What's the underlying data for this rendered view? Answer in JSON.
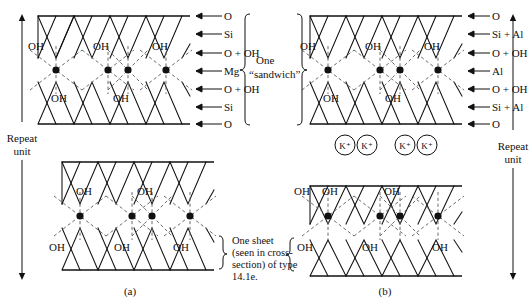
{
  "figure": {
    "panels": [
      {
        "id": "a",
        "caption": "(a)",
        "layer_labels": [
          "O",
          "Si",
          "O + OH",
          "Mg",
          "O + OH",
          "Si",
          "O"
        ],
        "bracket_note_line1": "One",
        "bracket_note_line2": "“sandwich”",
        "repeat_unit_line1": "Repeat",
        "repeat_unit_line2": "unit",
        "sheet_note": [
          "One sheet",
          "(seen in cross-",
          "section) of type",
          "14.1e."
        ],
        "hydroxyl_label": "OH",
        "top_block_oh_upper": [
          "OH",
          "OH",
          "OH"
        ],
        "top_block_oh_lower": [
          "OH",
          "OH"
        ],
        "bottom_block_oh_upper": [
          "OH",
          "OH"
        ],
        "bottom_block_oh_lower": [
          "OH",
          "OH",
          "OH"
        ]
      },
      {
        "id": "b",
        "caption": "(b)",
        "layer_labels": [
          "O",
          "Si + Al",
          "O + OH",
          "Al",
          "O + OH",
          "Si + Al",
          "O"
        ],
        "bracket_note_line1": "One",
        "bracket_note_line2": "“sandwich”",
        "repeat_unit_line1": "Repeat",
        "repeat_unit_line2": "unit",
        "interlayer_ions": [
          "K⁺",
          "K⁺",
          "K⁺",
          "K⁺"
        ],
        "hydroxyl_label": "OH",
        "top_block_oh_upper": [
          "OH",
          "OH",
          "OH"
        ],
        "top_block_oh_lower": [
          "OH",
          "OH"
        ],
        "bottom_block_oh_upper": [
          "OH",
          "OH",
          "OH"
        ],
        "bottom_block_oh_lower": [
          "OH",
          "OH",
          "OH"
        ]
      }
    ],
    "colors": {
      "line": "#111111",
      "dashed": "#6b6b6b",
      "background": "#ffffff"
    }
  }
}
